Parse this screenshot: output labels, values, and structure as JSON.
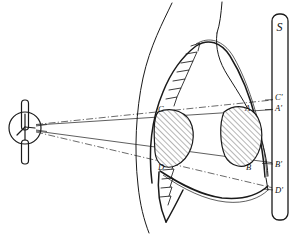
{
  "figure": {
    "line_colors": {
      "ink": "#1a1a1a",
      "ray_solid": "#2a2a2a",
      "ray_dash": "#3a3a3a",
      "background": "#ffffff"
    }
  },
  "source": {
    "name": "x-ray-tube",
    "focal_point": {
      "x": 35,
      "y": 128
    },
    "tube_circle": {
      "cx": 25,
      "cy": 128,
      "r": 16
    }
  },
  "screen": {
    "name": "film-screen",
    "label": "S",
    "bar": {
      "x": 272,
      "y": 14,
      "width": 16,
      "height": 206
    }
  },
  "lesions": [
    {
      "name": "anterior-opacity",
      "top_label": "C",
      "bottom_label": "D",
      "center": {
        "x": 178,
        "y": 135
      },
      "rx": 20,
      "ry": 25
    },
    {
      "name": "posterior-opacity",
      "top_label": "A",
      "bottom_label": "B",
      "center": {
        "x": 245,
        "y": 135
      },
      "rx": 21,
      "ry": 26
    }
  ],
  "object_labels": [
    {
      "id": "C",
      "text": "C",
      "x": 161,
      "y": 112
    },
    {
      "id": "D",
      "text": "D",
      "x": 161,
      "y": 170
    },
    {
      "id": "A",
      "text": "A",
      "x": 247,
      "y": 111
    },
    {
      "id": "B",
      "text": "B",
      "x": 248,
      "y": 170
    }
  ],
  "projected_labels": [
    {
      "id": "C-prime",
      "text": "C'",
      "x": 278,
      "y": 100
    },
    {
      "id": "A-prime",
      "text": "A'",
      "x": 278,
      "y": 110
    },
    {
      "id": "B-prime",
      "text": "B'",
      "x": 278,
      "y": 166
    },
    {
      "id": "D-prime",
      "text": "D'",
      "x": 278,
      "y": 192
    }
  ],
  "rays": [
    {
      "name": "ray-C-to-A-prime",
      "style": "solid",
      "from": "focus",
      "through": "C",
      "to": "A'"
    },
    {
      "name": "ray-C-to-C-prime",
      "style": "dash-dot",
      "from": "focus",
      "through": "C",
      "to": "C'"
    },
    {
      "name": "ray-D-to-B-prime",
      "style": "solid",
      "from": "focus",
      "through": "D",
      "to": "B'"
    },
    {
      "name": "ray-D-to-D-prime",
      "style": "dash-dot",
      "from": "focus",
      "through": "D",
      "to": "D'"
    }
  ],
  "anatomy": {
    "neck_outline": "neck and shoulder contour",
    "chest_wall": "anterior chest wall arc",
    "spine": "vertebral column with serrated processes",
    "diaphragm": "domed diaphragm curve",
    "posterior_wall": "posterior thoracic wall"
  }
}
